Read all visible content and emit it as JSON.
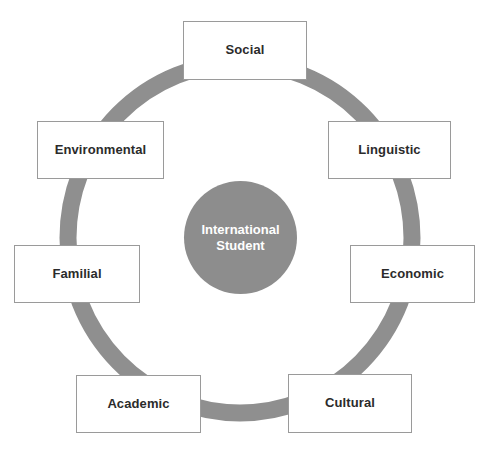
{
  "diagram": {
    "center": {
      "label": "International\nStudent",
      "color": "#8d8d8d",
      "text_color": "#ffffff"
    },
    "ring": {
      "color": "#8f8f8f",
      "thickness": 17
    },
    "box_style": {
      "fill": "#ffffff",
      "border_color": "#9a9a9a",
      "text_color": "#2b2b2b"
    },
    "nodes": [
      {
        "id": "social",
        "label": "Social"
      },
      {
        "id": "linguistic",
        "label": "Linguistic"
      },
      {
        "id": "economic",
        "label": "Economic"
      },
      {
        "id": "cultural",
        "label": "Cultural"
      },
      {
        "id": "academic",
        "label": "Academic"
      },
      {
        "id": "familial",
        "label": "Familial"
      },
      {
        "id": "environmental",
        "label": "Environmental"
      }
    ]
  }
}
